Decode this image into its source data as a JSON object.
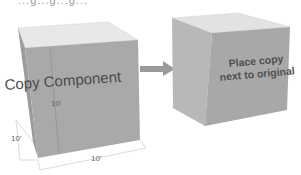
{
  "top_caption_clipped": "...g...g...g...",
  "left_cube": {
    "label": "Copy Component",
    "dimensions": {
      "height": "10'",
      "depth": "10'",
      "width": "10'"
    }
  },
  "arrow": {
    "direction": "right",
    "color": "#9a9a9a"
  },
  "right_cube": {
    "label_line1": "Place copy",
    "label_line2": "next to original"
  },
  "colors": {
    "cube_top": "#e6e6e6",
    "cube_front": "#a8a8a8",
    "cube_side": "#bcbcbc",
    "dimension_lines": "#d0d0d0"
  }
}
